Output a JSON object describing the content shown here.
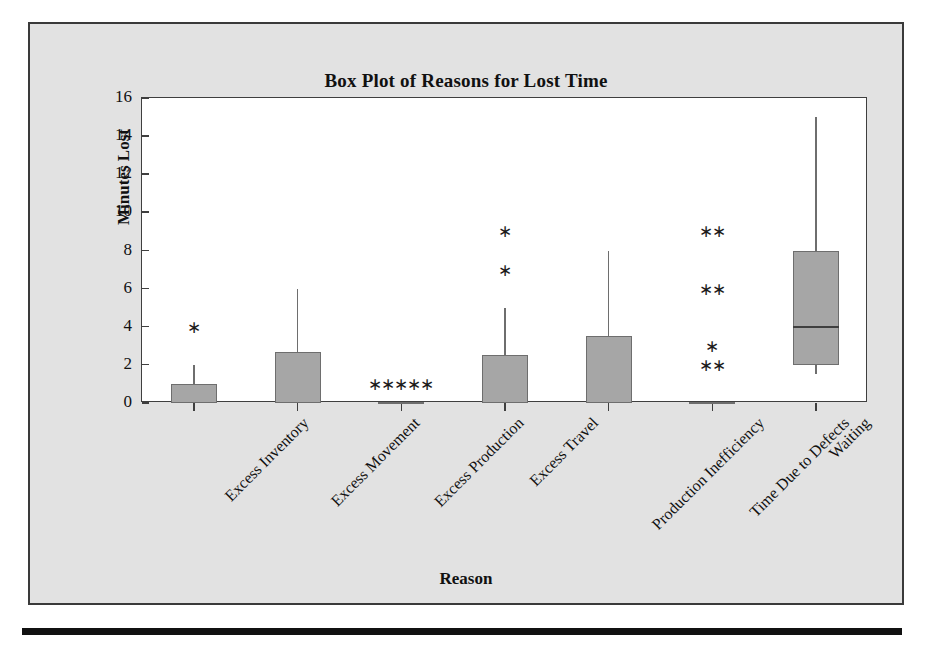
{
  "figure": {
    "title": "Box Plot of Reasons for Lost Time",
    "background_color": "#e2e2e2",
    "plot_background_color": "#ffffff",
    "frame_color": "#3a3a3a",
    "box_fill_color": "#a6a6a6",
    "box_edge_color": "#6e6e6e",
    "outlier_glyph": "asterisk-marker"
  },
  "chart_data": {
    "type": "box",
    "title": "Box Plot of Reasons for Lost Time",
    "xlabel": "Reason",
    "ylabel": "Minutes Lost",
    "ylim": [
      0,
      16
    ],
    "y_ticks": [
      0,
      2,
      4,
      6,
      8,
      10,
      12,
      14,
      16
    ],
    "grid": false,
    "legend": null,
    "categories": [
      "Excess Inventory",
      "Excess Movement",
      "Excess Production",
      "Excess Travel",
      "Production Inefficiency",
      "Time Due to Defects",
      "Waiting"
    ],
    "boxes": [
      {
        "category": "Excess Inventory",
        "whisker_low": 0,
        "q1": 0,
        "median": 0,
        "q3": 1,
        "whisker_high": 2,
        "outliers": [
          4
        ]
      },
      {
        "category": "Excess Movement",
        "whisker_low": 0,
        "q1": 0,
        "median": 0,
        "q3": 2.7,
        "whisker_high": 6,
        "outliers": []
      },
      {
        "category": "Excess Production",
        "whisker_low": 0,
        "q1": 0,
        "median": 0,
        "q3": 0,
        "whisker_high": 0,
        "outliers": [
          1,
          1,
          1,
          1,
          1
        ]
      },
      {
        "category": "Excess Travel",
        "whisker_low": 0,
        "q1": 0,
        "median": 0,
        "q3": 2.5,
        "whisker_high": 5,
        "outliers": [
          7,
          9
        ]
      },
      {
        "category": "Production Inefficiency",
        "whisker_low": 0,
        "q1": 0,
        "median": 0,
        "q3": 3.5,
        "whisker_high": 8,
        "outliers": []
      },
      {
        "category": "Time Due to Defects",
        "whisker_low": 0,
        "q1": 0,
        "median": 0,
        "q3": 0,
        "whisker_high": 0,
        "outliers": [
          2,
          2,
          3,
          6,
          6,
          9,
          9
        ]
      },
      {
        "category": "Waiting",
        "whisker_low": 1.5,
        "q1": 2,
        "median": 4,
        "q3": 8,
        "whisker_high": 15,
        "outliers": []
      }
    ]
  }
}
